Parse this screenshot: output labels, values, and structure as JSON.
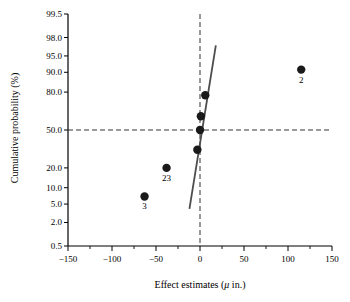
{
  "chart_data": {
    "type": "scatter",
    "title": "",
    "xlabel": "Effect estimates (μ in.)",
    "ylabel": "Cumulative probability (%)",
    "xlabel_prefix": "Effect estimates (",
    "xlabel_var": "μ",
    "xlabel_suffix": " in.)",
    "xlim": [
      -150,
      150
    ],
    "xticks": [
      -150,
      -100,
      -50,
      0,
      50,
      100,
      150
    ],
    "xticklabels": [
      "−150",
      "−100",
      "−50",
      "0",
      "50",
      "100",
      "150"
    ],
    "xminorticks": [
      -125,
      -75,
      -25,
      25,
      75,
      125
    ],
    "yscale": "normal-probability",
    "ylim": [
      0.5,
      99.5
    ],
    "yticks": [
      99.5,
      98.0,
      95.0,
      90.0,
      80.0,
      50.0,
      20.0,
      10.0,
      5.0,
      2.0,
      0.5
    ],
    "yticklabels": [
      "99.5",
      "98.0",
      "95.0",
      "90.0",
      "80.0",
      "50.0",
      "20.0",
      "10.0",
      "5.0",
      "2.0",
      "0.5"
    ],
    "grid": false,
    "legend": null,
    "points": [
      {
        "x": -63,
        "y": 7.0,
        "label": "3"
      },
      {
        "x": -38,
        "y": 20.0,
        "label": "23"
      },
      {
        "x": -3,
        "y": 33.0,
        "label": ""
      },
      {
        "x": 0,
        "y": 50.0,
        "label": ""
      },
      {
        "x": 1,
        "y": 62.0,
        "label": ""
      },
      {
        "x": 6,
        "y": 78.0,
        "label": ""
      },
      {
        "x": 115,
        "y": 91.0,
        "label": "2"
      }
    ],
    "reference_lines": [
      {
        "name": "fifty-percent-line",
        "orientation": "horizontal",
        "value": 50.0,
        "style": "dashed"
      },
      {
        "name": "zero-effect-line",
        "orientation": "vertical",
        "value": 0,
        "style": "dashed"
      }
    ],
    "fit_line": {
      "name": "normal-reference-line",
      "style": "solid",
      "x_start": -12,
      "y_start": 4.0,
      "x_end": 18,
      "y_end": 97.0
    },
    "colors": {
      "axis": "#000000",
      "marker": "#1a1a1a",
      "fit_line": "#4d4d4d",
      "dashed_line": "#333333",
      "background": "#ffffff"
    },
    "marker": {
      "shape": "circle",
      "radius": 4.2
    }
  }
}
